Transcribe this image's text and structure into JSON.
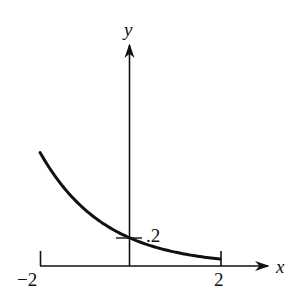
{
  "chart_data": {
    "type": "line",
    "title": "",
    "xlabel": "x",
    "ylabel": "y",
    "x_tick_labels": [
      "−2",
      "2"
    ],
    "x_ticks": [
      -2,
      2
    ],
    "annotations": [
      {
        "text": ".2",
        "x": 0,
        "y": 0.2,
        "note": "y-intercept marked with short horizontal tick"
      }
    ],
    "xlim": [
      -2,
      2
    ],
    "grid": false,
    "legend": null,
    "series": [
      {
        "name": "curve",
        "description": "decreasing exponential-like curve on [-2, 2] passing through (0, .2)",
        "x": [
          -2,
          -1.5,
          -1,
          -0.5,
          0,
          0.5,
          1,
          1.5,
          2
        ],
        "y": [
          0.81,
          0.57,
          0.4,
          0.28,
          0.2,
          0.14,
          0.1,
          0.07,
          0.05
        ]
      }
    ]
  },
  "labels": {
    "x_axis": "x",
    "y_axis": "y",
    "tick_neg2": "−2",
    "tick_2": "2",
    "intercept": ".2"
  },
  "colors": {
    "ink": "#111111",
    "background": "#ffffff"
  }
}
